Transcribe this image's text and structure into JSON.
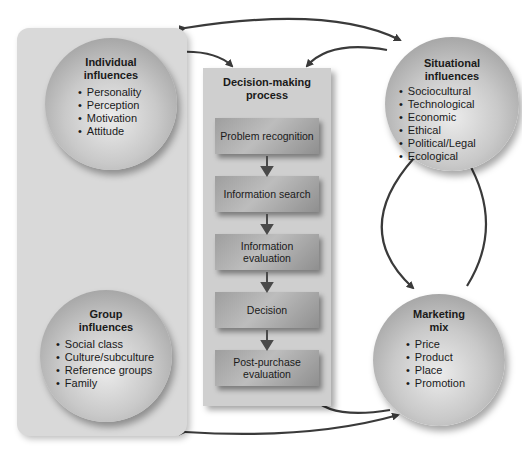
{
  "diagram": {
    "individual_influences": {
      "title_line1": "Individual",
      "title_line2": "influences",
      "items": [
        "Personality",
        "Perception",
        "Motivation",
        "Attitude"
      ]
    },
    "group_influences": {
      "title_line1": "Group",
      "title_line2": "influences",
      "items": [
        "Social class",
        "Culture/subculture",
        "Reference groups",
        "Family"
      ]
    },
    "situational_influences": {
      "title_line1": "Situational",
      "title_line2": "influences",
      "items": [
        "Sociocultural",
        "Technological",
        "Economic",
        "Ethical",
        "Political/Legal",
        "Ecological"
      ]
    },
    "marketing_mix": {
      "title_line1": "Marketing",
      "title_line2": "mix",
      "items": [
        "Price",
        "Product",
        "Place",
        "Promotion"
      ]
    },
    "decision_process": {
      "title_line1": "Decision-making",
      "title_line2": "process",
      "steps": [
        {
          "line1": "Problem recognition",
          "line2": ""
        },
        {
          "line1": "Information search",
          "line2": ""
        },
        {
          "line1": "Information",
          "line2": "evaluation"
        },
        {
          "line1": "Decision",
          "line2": ""
        },
        {
          "line1": "Post-purchase",
          "line2": "evaluation"
        }
      ]
    },
    "colors": {
      "arrow": "#3a3a3a",
      "panel": "#d9d9d9",
      "center_panel": "#cfcfcf"
    }
  }
}
